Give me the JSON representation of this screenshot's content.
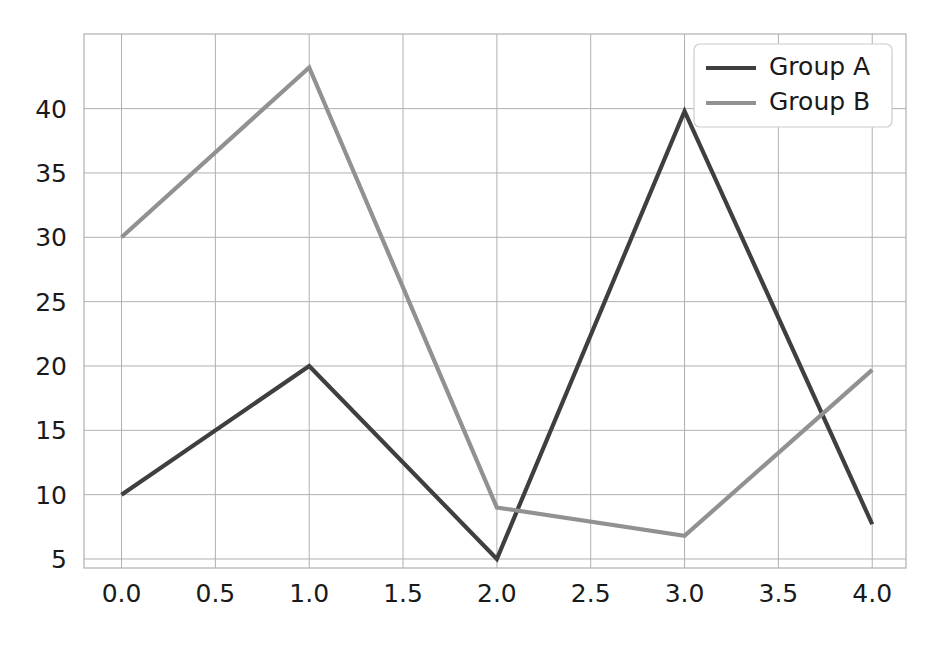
{
  "chart_data": {
    "type": "line",
    "title": "",
    "xlabel": "",
    "ylabel": "",
    "x": [
      0,
      1,
      2,
      3,
      4
    ],
    "series": [
      {
        "name": "Group A",
        "values": [
          10,
          20,
          5,
          39.8,
          7.7
        ],
        "color": "#3f3f3f"
      },
      {
        "name": "Group B",
        "values": [
          30,
          43.2,
          9,
          6.8,
          19.7
        ],
        "color": "#919191"
      }
    ],
    "xlim": [
      -0.2,
      4.18
    ],
    "ylim": [
      4.3,
      45.8
    ],
    "xticks": [
      0,
      0.5,
      1,
      1.5,
      2,
      2.5,
      3,
      3.5,
      4
    ],
    "xtick_labels": [
      "0.0",
      "0.5",
      "1.0",
      "1.5",
      "2.0",
      "2.5",
      "3.0",
      "3.5",
      "4.0"
    ],
    "yticks": [
      5,
      10,
      15,
      20,
      25,
      30,
      35,
      40
    ],
    "ytick_labels": [
      "5",
      "10",
      "15",
      "20",
      "25",
      "30",
      "35",
      "40"
    ],
    "grid": true,
    "legend_position": "upper right",
    "legend_entries": [
      "Group A",
      "Group B"
    ],
    "grid_color": "#b0b0b0",
    "axes_border_color": "#b0b0b0",
    "background_color": "#ffffff",
    "tick_label_color": "#1a1a1a"
  },
  "plot_geometry": {
    "left": 84,
    "right": 906,
    "top": 34,
    "bottom": 568
  },
  "legend_box": {
    "x": 694,
    "y": 44,
    "width": 198,
    "height": 83,
    "border_color": "#cccccc",
    "fill": "#ffffff"
  }
}
